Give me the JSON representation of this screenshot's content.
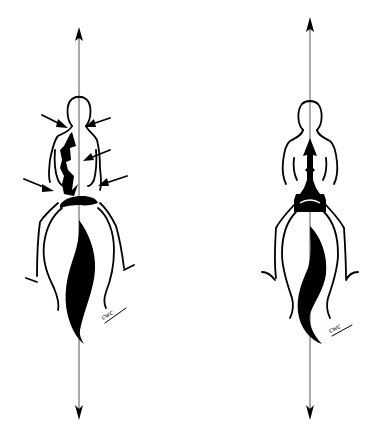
{
  "figures": [
    {
      "id": "left",
      "description": "Rider seen from behind on horse, crooked posture with external force arrows pressing on body",
      "axis_x": 79,
      "axis_top": 27,
      "axis_bottom": 420,
      "force_arrow_count": 5,
      "signature": "cwc"
    },
    {
      "id": "right",
      "description": "Rider seen from behind on horse, straight aligned posture with upward arrow along spine",
      "axis_x": 310,
      "axis_top": 17,
      "axis_bottom": 420,
      "signature": "cwc"
    }
  ],
  "colors": {
    "ink": "#000000",
    "axis": "#555555",
    "background": "#ffffff"
  }
}
